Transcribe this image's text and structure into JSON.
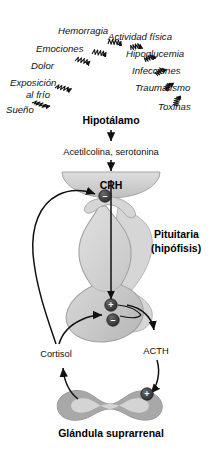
{
  "diagram": {
    "colors": {
      "background": "#ffffff",
      "ink": "#111111",
      "organ_fill": "#c9c9c9",
      "organ_fill_light": "#d9d9d9",
      "organ_stroke": "#9a9a9a",
      "node_fill": "#3a3a3a",
      "node_sign": "#ffffff",
      "adrenal_cortex": "#a5a5a5",
      "adrenal_medulla": "#d2d2d2"
    },
    "stressors": [
      {
        "id": "hemorragia",
        "label": "Hemorragia"
      },
      {
        "id": "emociones",
        "label": "Emociones"
      },
      {
        "id": "dolor",
        "label": "Dolor"
      },
      {
        "id": "exposicion-al-frio",
        "label": "Exposición",
        "label2": "al frío"
      },
      {
        "id": "sueno",
        "label": "Sueño"
      },
      {
        "id": "actividad-fisica",
        "label": "Actividad física"
      },
      {
        "id": "hipoglucemia",
        "label": "Hipoglucemia"
      },
      {
        "id": "infecciones",
        "label": "Infecciones"
      },
      {
        "id": "traumatismo",
        "label": "Traumatismo"
      },
      {
        "id": "toxinas",
        "label": "Toxinas"
      }
    ],
    "nodes": {
      "hypothalamus": "Hipotálamo",
      "neurotransmitters": "Acetilcolina, serotonina",
      "crh": "CRH",
      "pituitary_line1": "Pituitaria",
      "pituitary_line2": "(hipófisis)",
      "acth": "ACTH",
      "cortisol": "Cortisol",
      "adrenal": "Glándula suprarrenal"
    },
    "signs": {
      "negative": "–",
      "positive": "+"
    },
    "feedback_nodes": [
      {
        "id": "crh-inhibition",
        "sign": "–"
      },
      {
        "id": "pituitary-stimulation",
        "sign": "+"
      },
      {
        "id": "pituitary-inhibition",
        "sign": "–"
      },
      {
        "id": "adrenal-stimulation",
        "sign": "+"
      }
    ]
  }
}
